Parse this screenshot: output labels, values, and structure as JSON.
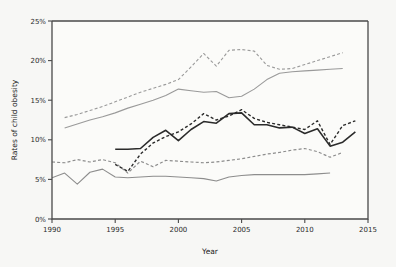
{
  "chart_data": {
    "type": "line",
    "title": "",
    "xlabel": "Year",
    "ylabel": "Rates of child obesity",
    "xlim": [
      1990,
      2015
    ],
    "ylim": [
      0,
      25
    ],
    "grid": false,
    "legend": "none",
    "xticks": [
      1990,
      1995,
      2000,
      2005,
      2010,
      2015
    ],
    "xticklabels": [
      "1990",
      "1995",
      "2000",
      "2005",
      "2010",
      "2015"
    ],
    "yticks": [
      0,
      5,
      10,
      15,
      20,
      25
    ],
    "yticklabels": [
      "0%",
      "5%",
      "10%",
      "15%",
      "20%",
      "25%"
    ],
    "series": [
      {
        "name": "upper-dashed-light",
        "style": "dashed",
        "color": "#9a9a9a",
        "width": 1.1,
        "x": [
          1991,
          1992,
          1993,
          1994,
          1995,
          1996,
          1997,
          1998,
          1999,
          2000,
          2001,
          2002,
          2003,
          2004,
          2005,
          2006,
          2007,
          2008,
          2009,
          2010,
          2011,
          2012,
          2013
        ],
        "y": [
          12.8,
          13.2,
          13.7,
          14.2,
          14.8,
          15.4,
          16.0,
          16.5,
          17.0,
          17.6,
          19.2,
          20.9,
          19.3,
          21.3,
          21.4,
          21.2,
          19.4,
          18.9,
          19.0,
          19.5,
          20.0,
          20.5,
          21.0
        ]
      },
      {
        "name": "upper-solid-light",
        "style": "solid",
        "color": "#9a9a9a",
        "width": 1.1,
        "x": [
          1991,
          1992,
          1993,
          1994,
          1995,
          1996,
          1997,
          1998,
          1999,
          2000,
          2001,
          2002,
          2003,
          2004,
          2005,
          2006,
          2007,
          2008,
          2009,
          2010,
          2011,
          2012,
          2013
        ],
        "y": [
          11.5,
          12.0,
          12.5,
          12.9,
          13.4,
          14.0,
          14.5,
          15.0,
          15.6,
          16.4,
          16.2,
          16.0,
          16.1,
          15.3,
          15.5,
          16.4,
          17.6,
          18.4,
          18.6,
          18.7,
          18.8,
          18.9,
          19.0
        ]
      },
      {
        "name": "mid-dashed-dark",
        "style": "dashed",
        "color": "#2b2b2b",
        "width": 1.4,
        "x": [
          1995,
          1996,
          1997,
          1998,
          1999,
          2000,
          2001,
          2002,
          2003,
          2004,
          2005,
          2006,
          2007,
          2008,
          2009,
          2010,
          2011,
          2012,
          2013,
          2014
        ],
        "y": [
          6.9,
          6.0,
          8.2,
          9.6,
          10.4,
          11.0,
          12.0,
          13.3,
          12.5,
          13.0,
          13.8,
          12.7,
          12.2,
          11.9,
          11.6,
          11.3,
          12.4,
          9.4,
          11.8,
          12.4
        ]
      },
      {
        "name": "mid-solid-dark",
        "style": "solid",
        "color": "#2b2b2b",
        "width": 1.6,
        "x": [
          1995,
          1996,
          1997,
          1998,
          1999,
          2000,
          2001,
          2002,
          2003,
          2004,
          2005,
          2006,
          2007,
          2008,
          2009,
          2010,
          2011,
          2012,
          2013,
          2014
        ],
        "y": [
          8.8,
          8.8,
          8.9,
          10.3,
          11.2,
          9.9,
          11.3,
          12.3,
          12.1,
          13.3,
          13.4,
          11.9,
          11.9,
          11.5,
          11.6,
          10.8,
          11.4,
          9.2,
          9.7,
          11.0
        ]
      },
      {
        "name": "lower-dashed-light",
        "style": "dashed",
        "color": "#8d8d8d",
        "width": 1.2,
        "x": [
          1990,
          1991,
          1992,
          1993,
          1994,
          1995,
          1996,
          1997,
          1998,
          1999,
          2000,
          2001,
          2002,
          2003,
          2004,
          2005,
          2006,
          2007,
          2008,
          2009,
          2010,
          2011,
          2012,
          2013
        ],
        "y": [
          7.2,
          7.1,
          7.5,
          7.2,
          7.5,
          7.1,
          5.8,
          7.3,
          6.6,
          7.4,
          7.3,
          7.2,
          7.1,
          7.2,
          7.4,
          7.6,
          7.9,
          8.2,
          8.4,
          8.7,
          8.9,
          8.5,
          7.8,
          8.4
        ]
      },
      {
        "name": "lower-solid-light",
        "style": "solid",
        "color": "#8d8d8d",
        "width": 1.1,
        "x": [
          1990,
          1991,
          1992,
          1993,
          1994,
          1995,
          1996,
          1997,
          1998,
          1999,
          2000,
          2001,
          2002,
          2003,
          2004,
          2005,
          2006,
          2007,
          2008,
          2009,
          2010,
          2011,
          2012
        ],
        "y": [
          5.2,
          5.8,
          4.4,
          5.9,
          6.3,
          5.3,
          5.2,
          5.3,
          5.4,
          5.4,
          5.3,
          5.2,
          5.1,
          4.8,
          5.3,
          5.5,
          5.6,
          5.6,
          5.6,
          5.6,
          5.6,
          5.7,
          5.8
        ]
      }
    ]
  },
  "style": {
    "background": "#f7f7f5",
    "axis_color": "#4a4a4a",
    "plot_background": "#fbfbf9"
  }
}
